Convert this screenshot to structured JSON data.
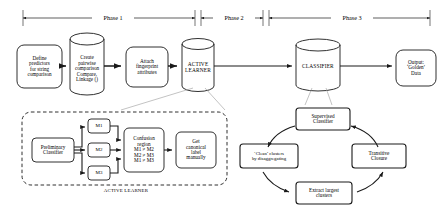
{
  "figure": {
    "phases": [
      {
        "id": "phase-1",
        "label": "Phase 1"
      },
      {
        "id": "phase-2",
        "label": "Phase 2"
      },
      {
        "id": "phase-3",
        "label": "Phase 3"
      }
    ],
    "main_flow": [
      {
        "id": "define-predictors",
        "shape": "rounded-box",
        "label": "Define\npredictors\nfor string\ncomparison"
      },
      {
        "id": "create-pairwise",
        "shape": "cylinder",
        "label": "Create\npairwise\ncomparison\nCompare.\nLinkage ()"
      },
      {
        "id": "attach-fingerprint",
        "shape": "rounded-box",
        "label": "Attach\nfingerprint\nattributes"
      },
      {
        "id": "active-learner",
        "shape": "cylinder",
        "label": "ACTIVE\nLEARNER"
      },
      {
        "id": "classifier",
        "shape": "cylinder",
        "label": "CLASSIFIER"
      },
      {
        "id": "output-golden-data",
        "shape": "rounded-box",
        "label": "Output:\n‘Golden’\nData"
      }
    ],
    "active_learner_detail": {
      "caption": "ACTIVE LEARNER",
      "nodes": [
        {
          "id": "preliminary-classifier",
          "label": "Preliminary\nClassifier"
        },
        {
          "id": "model-m1",
          "label": "M1"
        },
        {
          "id": "model-m2",
          "label": "M2"
        },
        {
          "id": "model-m3",
          "label": "M3"
        },
        {
          "id": "confusion-region",
          "label": "Confusion\nregion\nM1 ≠ M2\nM2 ≠ M3\nM1 ≠ M3"
        },
        {
          "id": "get-canonical-label",
          "label": "Get\ncanonical\nlabel\nmanually"
        }
      ]
    },
    "classifier_cycle": {
      "nodes": [
        {
          "id": "supervised-classifier",
          "position": "top",
          "label": "Supervised\nClassifier"
        },
        {
          "id": "transitive-closure",
          "position": "right",
          "label": "Transitive\nClosure"
        },
        {
          "id": "extract-largest-clusters",
          "position": "bottom",
          "label": "Extract largest\nclusters"
        },
        {
          "id": "clean-clusters",
          "position": "left",
          "label": "‘Clean’ clusters\nby disaggregating"
        }
      ]
    },
    "colors": {
      "stroke": "#1a1a1a",
      "background": "#ffffff",
      "callout": "#9a9a9a"
    }
  }
}
